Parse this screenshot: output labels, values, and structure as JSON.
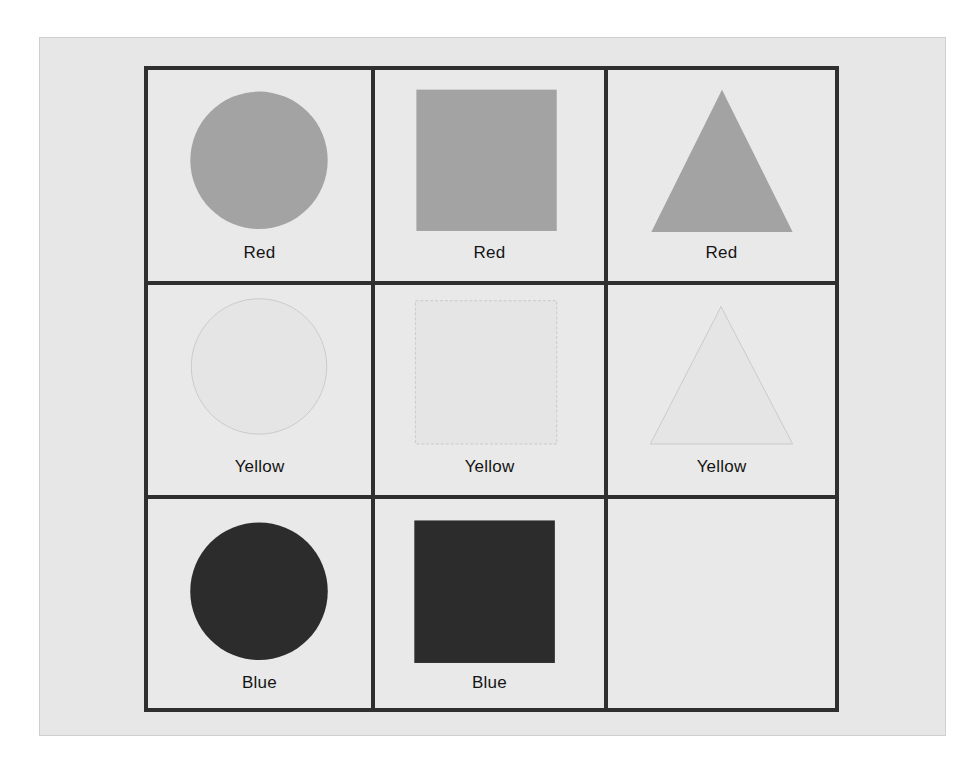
{
  "figure": {
    "rows": 3,
    "columns": 3,
    "colors": {
      "Red": "#a3a3a3",
      "Yellow": "#e6e6e6",
      "Yellow_outline": "#c9c9c9",
      "Blue": "#2c2c2c",
      "grid_line": "#2f2f2f",
      "panel_bg": "#e7e7e7"
    },
    "cells": [
      {
        "row": 0,
        "col": 0,
        "shape": "circle",
        "label": "Red"
      },
      {
        "row": 0,
        "col": 1,
        "shape": "square",
        "label": "Red"
      },
      {
        "row": 0,
        "col": 2,
        "shape": "triangle",
        "label": "Red"
      },
      {
        "row": 1,
        "col": 0,
        "shape": "circle",
        "label": "Yellow"
      },
      {
        "row": 1,
        "col": 1,
        "shape": "square",
        "label": "Yellow"
      },
      {
        "row": 1,
        "col": 2,
        "shape": "triangle",
        "label": "Yellow"
      },
      {
        "row": 2,
        "col": 0,
        "shape": "circle",
        "label": "Blue"
      },
      {
        "row": 2,
        "col": 1,
        "shape": "square",
        "label": "Blue"
      },
      {
        "row": 2,
        "col": 2,
        "shape": "empty",
        "label": ""
      }
    ]
  }
}
